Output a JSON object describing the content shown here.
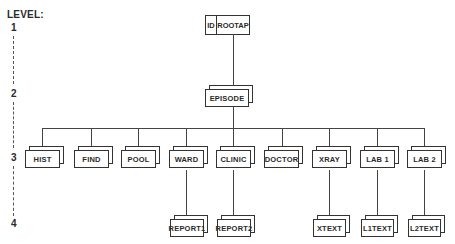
{
  "diagram": {
    "level_label": "LEVEL:",
    "levels": [
      "1",
      "2",
      "3",
      "4"
    ],
    "root": {
      "id_label": "ID",
      "name": "ROOTAP"
    },
    "level2": {
      "name": "EPISODE"
    },
    "level3": [
      {
        "name": "HIST"
      },
      {
        "name": "FIND"
      },
      {
        "name": "POOL"
      },
      {
        "name": "WARD"
      },
      {
        "name": "CLINIC"
      },
      {
        "name": "DOCTOR"
      },
      {
        "name": "XRAY"
      },
      {
        "name": "LAB 1"
      },
      {
        "name": "LAB 2"
      }
    ],
    "level4": [
      {
        "name": "REPORT1",
        "parent": "WARD"
      },
      {
        "name": "REPORT2",
        "parent": "CLINIC"
      },
      {
        "name": "XTEXT",
        "parent": "XRAY"
      },
      {
        "name": "L1TEXT",
        "parent": "LAB 1"
      },
      {
        "name": "L2TEXT",
        "parent": "LAB 2"
      }
    ]
  }
}
